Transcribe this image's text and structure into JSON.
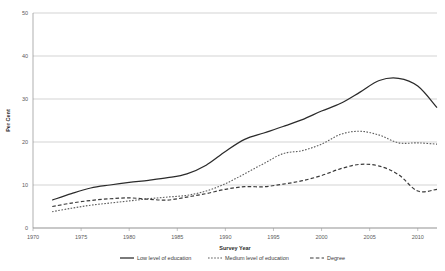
{
  "chart_data": {
    "type": "line",
    "title": "",
    "xlabel": "Survey Year",
    "ylabel": "Per Cent",
    "xlim": [
      1970,
      2012
    ],
    "ylim": [
      0,
      50
    ],
    "xticks": [
      1970,
      1975,
      1980,
      1985,
      1990,
      1995,
      2000,
      2005,
      2010
    ],
    "yticks": [
      0,
      10,
      20,
      30,
      40,
      50
    ],
    "grid": "horizontal",
    "legend_position": "bottom",
    "series": [
      {
        "name": "Low level of education",
        "style": "solid",
        "color": "#2b2b2b",
        "x": [
          1972,
          1974,
          1976,
          1978,
          1980,
          1982,
          1984,
          1986,
          1988,
          1990,
          1992,
          1994,
          1996,
          1998,
          2000,
          2002,
          2004,
          2006,
          2008,
          2010,
          2012
        ],
        "values": [
          6.5,
          8.0,
          9.3,
          10.0,
          10.6,
          11.1,
          11.7,
          12.6,
          14.6,
          17.8,
          20.6,
          22.1,
          23.6,
          25.2,
          27.2,
          29.0,
          31.6,
          34.3,
          34.8,
          33.0,
          28.0
        ]
      },
      {
        "name": "Medium level of education",
        "style": "dotted",
        "color": "#5e5e5e",
        "x": [
          1972,
          1974,
          1976,
          1978,
          1980,
          1982,
          1984,
          1986,
          1988,
          1990,
          1992,
          1994,
          1996,
          1998,
          2000,
          2002,
          2004,
          2006,
          2008,
          2010,
          2012
        ],
        "values": [
          3.8,
          4.6,
          5.3,
          5.8,
          6.3,
          6.8,
          7.2,
          7.6,
          8.6,
          10.3,
          12.6,
          15.0,
          17.3,
          18.0,
          19.5,
          21.8,
          22.5,
          21.6,
          19.8,
          19.8,
          19.5
        ]
      },
      {
        "name": "Degree",
        "style": "dashed",
        "color": "#3a3a3a",
        "x": [
          1972,
          1974,
          1976,
          1978,
          1980,
          1982,
          1984,
          1986,
          1988,
          1990,
          1992,
          1994,
          1996,
          1998,
          2000,
          2002,
          2004,
          2006,
          2008,
          2010,
          2012
        ],
        "values": [
          5.0,
          5.8,
          6.4,
          6.8,
          7.0,
          6.7,
          6.5,
          7.2,
          8.0,
          9.0,
          9.6,
          9.6,
          10.2,
          11.0,
          12.2,
          13.8,
          14.8,
          14.4,
          12.4,
          8.6,
          9.0
        ]
      }
    ]
  },
  "legend": {
    "items": [
      {
        "label": "Low level of education",
        "style": "solid"
      },
      {
        "label": "Medium level of education",
        "style": "dotted"
      },
      {
        "label": "Degree",
        "style": "dashed"
      }
    ]
  }
}
